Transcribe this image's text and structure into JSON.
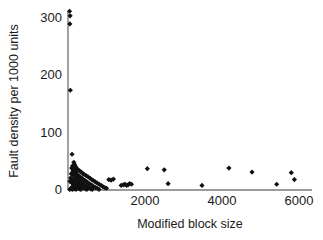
{
  "chart_data": {
    "type": "scatter",
    "title": "",
    "xlabel": "Modified block size",
    "ylabel": "Fault density per 1000 units",
    "xlim": [
      0,
      6200
    ],
    "ylim": [
      0,
      320
    ],
    "xticks": [
      2000,
      4000,
      6000
    ],
    "xtick_labels": [
      "2000",
      "4000",
      "6000"
    ],
    "yticks": [
      0,
      100,
      200,
      300
    ],
    "ytick_labels": [
      "0",
      "100",
      "200",
      "300"
    ],
    "grid": false,
    "legend": "none",
    "marker": "diamond",
    "marker_color": "#111111",
    "axis_color": "#7a7a7a",
    "points": [
      [
        40,
        310
      ],
      [
        55,
        302
      ],
      [
        48,
        288
      ],
      [
        60,
        173
      ],
      [
        105,
        62
      ],
      [
        150,
        48
      ],
      [
        175,
        44
      ],
      [
        120,
        42
      ],
      [
        200,
        40
      ],
      [
        95,
        38
      ],
      [
        230,
        37
      ],
      [
        160,
        36
      ],
      [
        260,
        35
      ],
      [
        135,
        34
      ],
      [
        300,
        33
      ],
      [
        190,
        32
      ],
      [
        340,
        31
      ],
      [
        115,
        30
      ],
      [
        380,
        29
      ],
      [
        215,
        29
      ],
      [
        85,
        28
      ],
      [
        420,
        27
      ],
      [
        245,
        26
      ],
      [
        145,
        26
      ],
      [
        470,
        25
      ],
      [
        290,
        24
      ],
      [
        170,
        24
      ],
      [
        520,
        23
      ],
      [
        325,
        22
      ],
      [
        200,
        22
      ],
      [
        70,
        21
      ],
      [
        575,
        20
      ],
      [
        365,
        20
      ],
      [
        235,
        19
      ],
      [
        110,
        19
      ],
      [
        620,
        18
      ],
      [
        405,
        18
      ],
      [
        275,
        17
      ],
      [
        140,
        17
      ],
      [
        665,
        16
      ],
      [
        450,
        16
      ],
      [
        310,
        15
      ],
      [
        180,
        15
      ],
      [
        50,
        15
      ],
      [
        710,
        14
      ],
      [
        490,
        14
      ],
      [
        350,
        13
      ],
      [
        220,
        13
      ],
      [
        90,
        13
      ],
      [
        760,
        12
      ],
      [
        535,
        12
      ],
      [
        390,
        11
      ],
      [
        255,
        11
      ],
      [
        125,
        11
      ],
      [
        810,
        10
      ],
      [
        580,
        10
      ],
      [
        430,
        9
      ],
      [
        295,
        9
      ],
      [
        160,
        9
      ],
      [
        860,
        8
      ],
      [
        625,
        8
      ],
      [
        470,
        7
      ],
      [
        330,
        7
      ],
      [
        195,
        7
      ],
      [
        905,
        6
      ],
      [
        670,
        6
      ],
      [
        510,
        6
      ],
      [
        370,
        5
      ],
      [
        230,
        5
      ],
      [
        105,
        5
      ],
      [
        955,
        4
      ],
      [
        715,
        4
      ],
      [
        550,
        4
      ],
      [
        410,
        4
      ],
      [
        265,
        3
      ],
      [
        140,
        3
      ],
      [
        1000,
        3
      ],
      [
        760,
        3
      ],
      [
        590,
        2
      ],
      [
        450,
        2
      ],
      [
        300,
        2
      ],
      [
        175,
        2
      ],
      [
        75,
        2
      ],
      [
        805,
        1
      ],
      [
        630,
        1
      ],
      [
        490,
        1
      ],
      [
        335,
        1
      ],
      [
        210,
        1
      ],
      [
        115,
        1
      ],
      [
        45,
        1
      ],
      [
        1060,
        18
      ],
      [
        1120,
        17
      ],
      [
        1180,
        19
      ],
      [
        1380,
        8
      ],
      [
        1440,
        9
      ],
      [
        1480,
        10
      ],
      [
        1520,
        8
      ],
      [
        1560,
        9
      ],
      [
        1600,
        11
      ],
      [
        1650,
        10
      ],
      [
        2060,
        37
      ],
      [
        2500,
        35
      ],
      [
        2600,
        11
      ],
      [
        3480,
        8
      ],
      [
        4180,
        38
      ],
      [
        4780,
        31
      ],
      [
        5420,
        10
      ],
      [
        5800,
        30
      ],
      [
        5880,
        18
      ]
    ]
  }
}
